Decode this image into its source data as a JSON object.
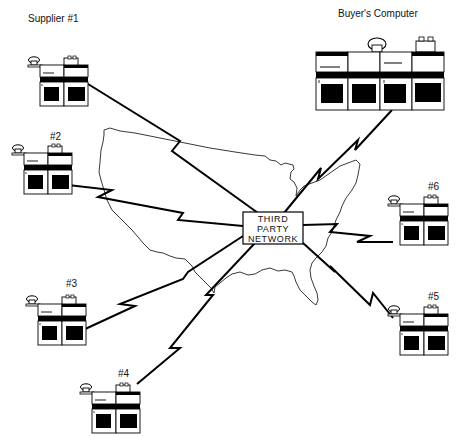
{
  "hub": {
    "lines": [
      "THIRD",
      "PARTY",
      "NETWORK"
    ]
  },
  "buyer": {
    "label": "Buyer's Computer"
  },
  "suppliers": [
    {
      "id": "supplier-1",
      "label": "Supplier #1"
    },
    {
      "id": "supplier-2",
      "label": "#2"
    },
    {
      "id": "supplier-3",
      "label": "#3"
    },
    {
      "id": "supplier-4",
      "label": "#4"
    },
    {
      "id": "supplier-5",
      "label": "#5"
    },
    {
      "id": "supplier-6",
      "label": "#6"
    }
  ],
  "background": "US map outline",
  "colors": {
    "ink": "#000000",
    "paper": "#ffffff"
  }
}
